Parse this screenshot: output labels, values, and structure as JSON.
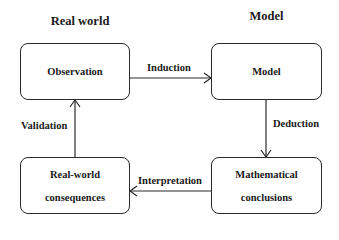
{
  "headings": {
    "left": "Real world",
    "right": "Model"
  },
  "nodes": {
    "observation": {
      "lines": [
        "Observation"
      ]
    },
    "model": {
      "lines": [
        "Model"
      ]
    },
    "consequences": {
      "lines": [
        "Real-world",
        "consequences"
      ]
    },
    "conclusions": {
      "lines": [
        "Mathematical",
        "conclusions"
      ]
    }
  },
  "edges": {
    "induction": "Induction",
    "deduction": "Deduction",
    "interpretation": "Interpretation",
    "validation": "Validation"
  },
  "colors": {
    "stroke": "#2a2a2a",
    "text": "#1a1a1a",
    "background": "#ffffff"
  }
}
